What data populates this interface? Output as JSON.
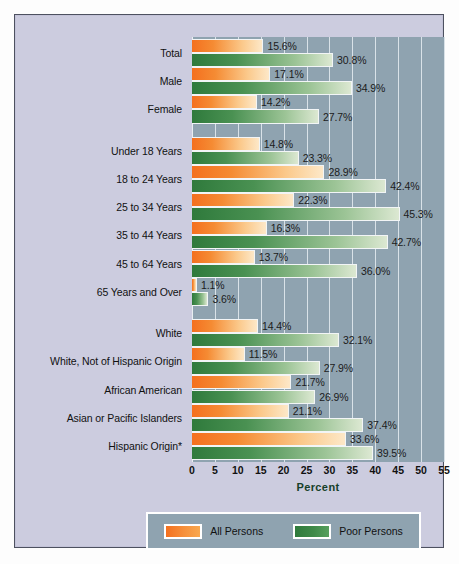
{
  "chart_data": {
    "type": "bar",
    "orientation": "horizontal",
    "title": "",
    "xlabel": "Percent",
    "ylabel": "",
    "xlim": [
      0,
      55
    ],
    "xticks": [
      "0",
      "5",
      "10",
      "15",
      "20",
      "25",
      "30",
      "35",
      "40",
      "45",
      "50",
      "55"
    ],
    "grid": true,
    "legend_position": "bottom",
    "categories": [
      "Total",
      "Male",
      "Female",
      "Under 18 Years",
      "18 to 24 Years",
      "25 to 34 Years",
      "35 to 44 Years",
      "45 to 64 Years",
      "65 Years and Over",
      "White",
      "White, Not of Hispanic Origin",
      "African American",
      "Asian or Pacific Islanders",
      "Hispanic Origin*"
    ],
    "group_breaks_after": [
      2,
      8
    ],
    "series": [
      {
        "name": "All Persons",
        "color": "#f4701f",
        "values": [
          15.6,
          17.1,
          14.2,
          14.8,
          28.9,
          22.3,
          16.3,
          13.7,
          1.1,
          14.4,
          11.5,
          21.7,
          21.1,
          33.6
        ],
        "labels": [
          "15.6%",
          "17.1%",
          "14.2%",
          "14.8%",
          "28.9%",
          "22.3%",
          "16.3%",
          "13.7%",
          "1.1%",
          "14.4%",
          "11.5%",
          "21.7%",
          "21.1%",
          "33.6%"
        ]
      },
      {
        "name": "Poor Persons",
        "color": "#2f7a3c",
        "values": [
          30.8,
          34.9,
          27.7,
          23.3,
          42.4,
          45.3,
          42.7,
          36.0,
          3.6,
          32.1,
          27.9,
          26.9,
          37.4,
          39.5
        ],
        "labels": [
          "30.8%",
          "34.9%",
          "27.7%",
          "23.3%",
          "42.4%",
          "45.3%",
          "42.7%",
          "36.0%",
          "3.6%",
          "32.1%",
          "27.9%",
          "26.9%",
          "37.4%",
          "39.5%"
        ]
      }
    ]
  },
  "legend": {
    "items": [
      {
        "label": "All Persons",
        "swatch": "all"
      },
      {
        "label": "Poor Persons",
        "swatch": "poor"
      }
    ]
  },
  "colors": {
    "plot_background": "#8fa3b0",
    "canvas_background": "#ccccdf",
    "gridline": "#d9e2e8",
    "all_persons": "#f4701f",
    "poor_persons": "#2f7a3c",
    "axis_title": "#16402a"
  }
}
